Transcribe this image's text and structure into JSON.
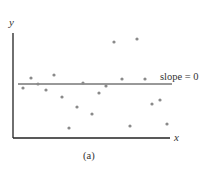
{
  "chart_data": {
    "type": "scatter",
    "title": "",
    "xlabel": "x",
    "ylabel": "y",
    "caption": "(a)",
    "annotation": "slope = 0",
    "grid": false,
    "regression_line": {
      "slope": 0,
      "y_pixel": 84,
      "x_start": 18,
      "x_end": 172
    },
    "points_pixel": [
      [
        23,
        88
      ],
      [
        31,
        78
      ],
      [
        38,
        84
      ],
      [
        46,
        90
      ],
      [
        54,
        75
      ],
      [
        62,
        97
      ],
      [
        69,
        128
      ],
      [
        77,
        107
      ],
      [
        83,
        83
      ],
      [
        92,
        114
      ],
      [
        99,
        93
      ],
      [
        106,
        86
      ],
      [
        114,
        42
      ],
      [
        122,
        79
      ],
      [
        130,
        126
      ],
      [
        137,
        39
      ],
      [
        145,
        79
      ],
      [
        152,
        104
      ],
      [
        160,
        100
      ],
      [
        167,
        124
      ]
    ]
  },
  "colors": {
    "axis": "#222222",
    "line": "#333333",
    "point": "#8a8a8a"
  }
}
